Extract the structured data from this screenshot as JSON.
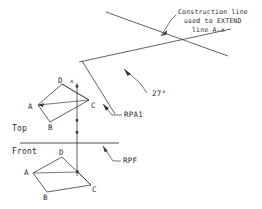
{
  "drawing": {
    "kind": "descriptive-geometry-orthographic-projection",
    "background_color": "#ffffff",
    "line_color": "#3a3a3a",
    "text_color": "#2a2a2a",
    "width": 262,
    "height": 209
  },
  "annotations": {
    "construction_note": {
      "line1": "Construction line",
      "line2": "used to EXTEND",
      "line3": "line A-x"
    },
    "angle_label": "27°",
    "reference_plane_auxiliary": "RPA1",
    "reference_plane_frontal": "RPF"
  },
  "views": {
    "top": {
      "label": "Top",
      "vertices": [
        {
          "label": "A"
        },
        {
          "label": "B"
        },
        {
          "label": "C"
        },
        {
          "label": "D"
        }
      ],
      "point_x": "x"
    },
    "front": {
      "label": "Front",
      "vertices": [
        {
          "label": "A"
        },
        {
          "label": "B"
        },
        {
          "label": "C"
        },
        {
          "label": "D"
        }
      ],
      "point_x": "x"
    }
  },
  "geometry": {
    "construction_line_upper": {
      "x1": 106,
      "y1": 12,
      "x2": 228,
      "y2": 56
    },
    "construction_line_lower": {
      "x1": 79,
      "y1": 61,
      "x2": 230,
      "y2": 30
    },
    "aux_fold_line": {
      "x1": 82,
      "y1": 62,
      "x2": 114,
      "y2": 113
    },
    "projector_vertical": {
      "x1": 77,
      "y1": 83,
      "x2": 77,
      "y2": 175
    },
    "rpf_horizontal": {
      "x1": 20,
      "y1": 143,
      "x2": 118,
      "y2": 143
    },
    "top_polygon": "A(38,105) B(50,122) C(88,100) D(62,84)",
    "front_polygon": "A(33,173) B(47,192) C(91,185) D(62,157)"
  }
}
